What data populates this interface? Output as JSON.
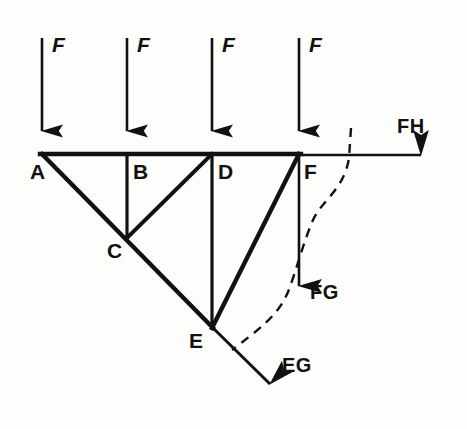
{
  "figure": {
    "type": "truss-free-body-diagram",
    "background_color": "#fdfdfc",
    "line_color": "#111111"
  },
  "nodes": [
    {
      "id": "A",
      "label": "A",
      "x": 42,
      "y": 154,
      "label_x": 30,
      "label_y": 163
    },
    {
      "id": "B",
      "label": "B",
      "x": 127,
      "y": 154,
      "label_x": 132,
      "label_y": 163
    },
    {
      "id": "C",
      "label": "C",
      "x": 127,
      "y": 237,
      "label_x": 108,
      "label_y": 243
    },
    {
      "id": "D",
      "label": "D",
      "x": 212,
      "y": 154,
      "label_x": 217,
      "label_y": 163
    },
    {
      "id": "E",
      "label": "E",
      "x": 212,
      "y": 327,
      "label_x": 190,
      "label_y": 333
    },
    {
      "id": "F",
      "label": "F",
      "x": 299,
      "y": 154,
      "label_x": 304,
      "label_y": 163
    }
  ],
  "members": [
    {
      "name": "top-chord-A-F",
      "from": "A",
      "to": "F",
      "x1": 42,
      "y1": 154,
      "x2": 299,
      "y2": 154,
      "width": 4
    },
    {
      "name": "diagonal-chord-A-E",
      "from": "A",
      "to": "E",
      "x1": 42,
      "y1": 154,
      "x2": 212,
      "y2": 327,
      "width": 4
    },
    {
      "name": "vertical-B-C",
      "from": "B",
      "to": "C",
      "x1": 127,
      "y1": 154,
      "x2": 127,
      "y2": 237,
      "width": 3
    },
    {
      "name": "diagonal-C-D",
      "from": "C",
      "to": "D",
      "x1": 127,
      "y1": 237,
      "x2": 212,
      "y2": 154,
      "width": 4
    },
    {
      "name": "vertical-D-E",
      "from": "D",
      "to": "E",
      "x1": 212,
      "y1": 154,
      "x2": 212,
      "y2": 327,
      "width": 3
    },
    {
      "name": "diagonal-E-F",
      "from": "E",
      "to": "F",
      "x1": 212,
      "y1": 327,
      "x2": 299,
      "y2": 154,
      "width": 4
    }
  ],
  "applied_loads": [
    {
      "name": "load-F-at-A",
      "label": "F",
      "at_node": "A",
      "x": 42,
      "y_start": 38,
      "y_end": 153,
      "label_x": 52,
      "label_y": 34
    },
    {
      "name": "load-F-at-B",
      "label": "F",
      "at_node": "B",
      "x": 127,
      "y_start": 38,
      "y_end": 153,
      "label_x": 137,
      "label_y": 34
    },
    {
      "name": "load-F-at-D",
      "label": "F",
      "at_node": "D",
      "x": 212,
      "y_start": 38,
      "y_end": 153,
      "label_x": 222,
      "label_y": 34
    },
    {
      "name": "load-F-at-F",
      "label": "F",
      "at_node": "F",
      "x": 299,
      "y_start": 38,
      "y_end": 153,
      "label_x": 309,
      "label_y": 34
    }
  ],
  "internal_forces": [
    {
      "name": "force-FH",
      "label": "FH",
      "direction": "right",
      "x1": 299,
      "y1": 155,
      "x2": 443,
      "y2": 155,
      "label_x": 397,
      "label_y": 118
    },
    {
      "name": "force-FG",
      "label": "FG",
      "direction": "down",
      "x1": 299,
      "y1": 155,
      "x2": 299,
      "y2": 308,
      "label_x": 310,
      "label_y": 283
    },
    {
      "name": "force-EG",
      "label": "EG",
      "direction": "down-right",
      "x1": 212,
      "y1": 327,
      "x2": 286,
      "y2": 400,
      "label_x": 283,
      "label_y": 356
    }
  ],
  "section_cut": {
    "name": "section-cut-line",
    "style": "dashed",
    "path": "M 351,128 L 349,158 C 344,190 322,200 313,220 C 303,243 296,272 288,292 C 278,316 258,330 232,350",
    "dash_pattern": "9 7",
    "width": 2.4
  }
}
